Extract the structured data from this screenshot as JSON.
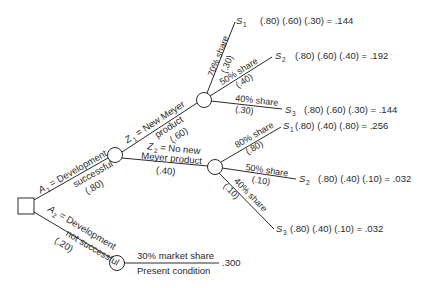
{
  "diagram": {
    "type": "decision-tree",
    "decision_node": {
      "label": ""
    },
    "branches": {
      "a1": {
        "var": "A",
        "sub": "1",
        "line1": "= Development",
        "line2": "successful",
        "prob": "(.80)"
      },
      "a2": {
        "var": "A",
        "sub": "2",
        "line1": "= Development",
        "line2": "not successful",
        "prob": "(.20)"
      },
      "z1": {
        "var": "Z",
        "sub": "1",
        "line1": "= New Meyer",
        "line2": "product",
        "prob": "(.60)"
      },
      "z2": {
        "var": "Z",
        "sub": "2",
        "line1": "= No new",
        "line2": "Meyer product",
        "prob": "(.40)"
      },
      "upper_s1": {
        "share": "70% share",
        "prob": "(.30)"
      },
      "upper_s2": {
        "share": "50% share",
        "prob": "(.40)"
      },
      "upper_s3": {
        "share": "40% share",
        "prob": "(.30)"
      },
      "lower_s1": {
        "share": "80% share",
        "prob": "(.80)"
      },
      "lower_s2": {
        "share": "50% share",
        "prob": "(.10)"
      },
      "lower_s3": {
        "share": "40% share",
        "prob": "(.10)"
      },
      "present": {
        "line1": "30% market share",
        "line2": "Present condition"
      }
    },
    "outcomes": [
      {
        "state": "S",
        "sub": "1",
        "expr": "(.80) (.60) (.30) = .144"
      },
      {
        "state": "S",
        "sub": "2",
        "expr": "(.80) (.60) (.40) = .192"
      },
      {
        "state": "S",
        "sub": "3",
        "expr": "(.80) (.60) (.30) = .144"
      },
      {
        "state": "S",
        "sub": "1",
        "expr": "(.80) (.40) (.80) = .256"
      },
      {
        "state": "S",
        "sub": "2",
        "expr": "(.80) (.40) (.10) = .032"
      },
      {
        "state": "S",
        "sub": "3",
        "expr": "(.80) (.40) (.10) = .032"
      },
      {
        "state": "",
        "sub": "",
        "expr": ".300"
      }
    ]
  }
}
